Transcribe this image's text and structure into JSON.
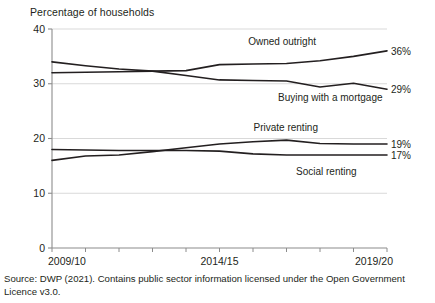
{
  "chart_data": {
    "type": "line",
    "title": "",
    "ylabel": "Percentage of households",
    "xlabel": "",
    "ylim": [
      0,
      40
    ],
    "yticks": [
      0,
      10,
      20,
      30,
      40
    ],
    "grid": true,
    "legend": "inline-end-labels",
    "x": [
      "2009/10",
      "2010/11",
      "2011/12",
      "2012/13",
      "2013/14",
      "2014/15",
      "2015/16",
      "2016/17",
      "2017/18",
      "2018/19",
      "2019/20"
    ],
    "xtick_labels": [
      "2009/10",
      "2014/15",
      "2019/20"
    ],
    "series": [
      {
        "name": "Owned outright",
        "end_value_label": "36%",
        "values": [
          32.0,
          32.1,
          32.2,
          32.3,
          32.4,
          33.5,
          33.6,
          33.7,
          34.2,
          35.0,
          36.0
        ]
      },
      {
        "name": "Buying with a mortgage",
        "end_value_label": "29%",
        "values": [
          34.0,
          33.3,
          32.7,
          32.3,
          31.5,
          30.7,
          30.6,
          30.5,
          29.4,
          30.1,
          29.0
        ]
      },
      {
        "name": "Private renting",
        "end_value_label": "19%",
        "values": [
          16.0,
          16.8,
          17.0,
          17.6,
          18.3,
          19.0,
          19.4,
          19.7,
          19.1,
          19.0,
          19.0
        ]
      },
      {
        "name": "Social renting",
        "end_value_label": "17%",
        "values": [
          18.0,
          17.9,
          17.8,
          17.8,
          17.8,
          17.7,
          17.2,
          17.0,
          17.0,
          17.0,
          17.0
        ]
      }
    ]
  },
  "source": {
    "text": "Source: DWP (2021). Contains public sector information licensed under the Open Government Licence v3.0."
  }
}
